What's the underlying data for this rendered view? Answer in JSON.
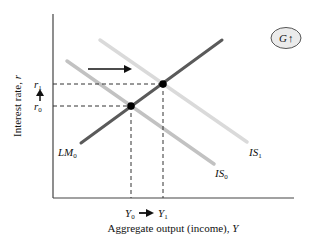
{
  "diagram": {
    "type": "IS-LM",
    "axes": {
      "y_label": "Interest rate, ",
      "y_label_var": "r",
      "x_label": "Aggregate output (income), ",
      "x_label_var": "Y"
    },
    "curves": [
      {
        "id": "LM0",
        "label_main": "LM",
        "label_sub": "0",
        "color": "#5a5a5a"
      },
      {
        "id": "IS0",
        "label_main": "IS",
        "label_sub": "0",
        "color": "#bdbdbd"
      },
      {
        "id": "IS1",
        "label_main": "IS",
        "label_sub": "1",
        "color": "#d9d9d9"
      }
    ],
    "equilibria": [
      {
        "id": "1",
        "r_label_main": "r",
        "r_label_sub": "0",
        "y_label_main": "Y",
        "y_label_sub": "0"
      },
      {
        "id": "2",
        "r_label_main": "r",
        "r_label_sub": "1",
        "y_label_main": "Y",
        "y_label_sub": "1"
      }
    ],
    "badge": {
      "label": "G",
      "arrow": "↑",
      "fill": "#ebebeb"
    },
    "annotations": {
      "shift_arrow": "rightward shift of IS",
      "r_arrow": "interest rate rises",
      "y_arrow": "output rises"
    }
  }
}
